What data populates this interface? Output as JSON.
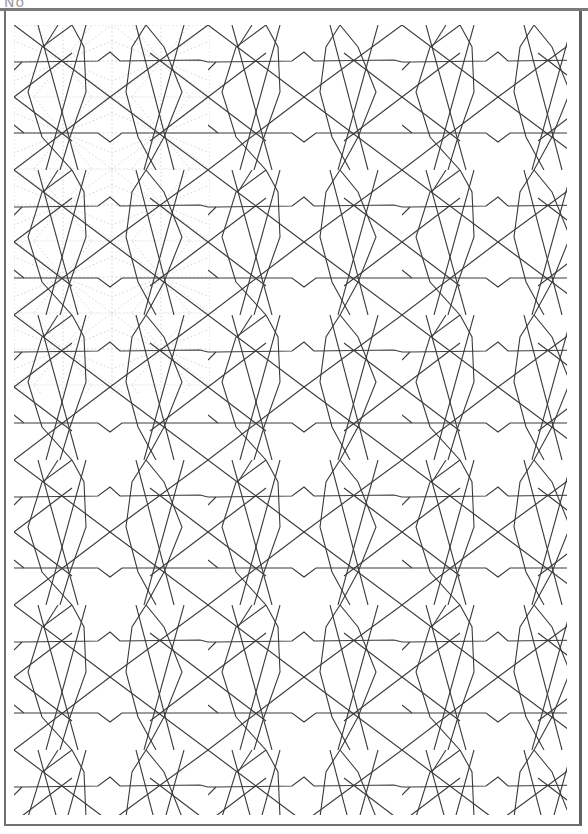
{
  "page": {
    "label": "No"
  },
  "drawing": {
    "line_color": "#3a3a3a",
    "guide_color": "#c4c4c4",
    "background": "#ffffff",
    "tile_width": 194,
    "tile_height": 145,
    "origin_x": 14,
    "origin_y": 25,
    "guide_region": {
      "x": 14,
      "y": 25,
      "width": 196,
      "height": 368
    }
  }
}
